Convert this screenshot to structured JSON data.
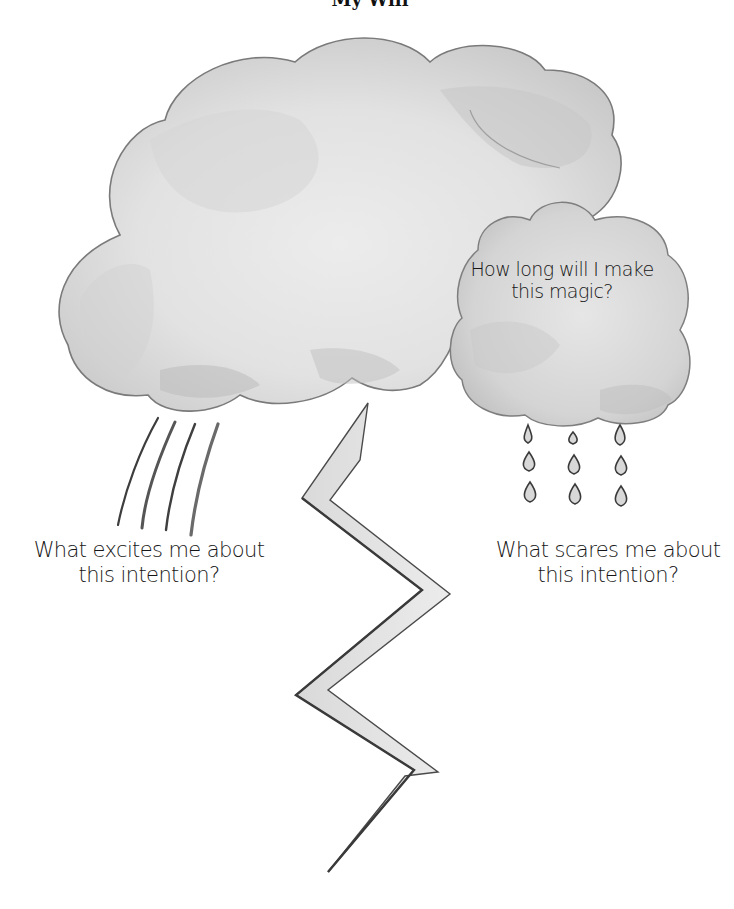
{
  "page": {
    "header_fragment": "My Will",
    "colors": {
      "background": "#ffffff",
      "cloud_fill": "#e4e4e4",
      "cloud_wash": "#cfcfcf",
      "cloud_edge": "#6a6a6a",
      "text": "#161616"
    }
  },
  "illustration": {
    "main_cloud": {
      "name": "storm-cloud",
      "description": "large grey watercolor cloud"
    },
    "small_cloud": {
      "name": "rain-cloud",
      "prompt_lines": [
        "How long will I make",
        "this magic?"
      ]
    },
    "wind_lines": {
      "count": 4
    },
    "raindrops": {
      "rows": 3,
      "columns": 3
    },
    "lightning_bolt": {
      "segments": 5
    }
  },
  "prompts": {
    "excites": {
      "lines": [
        "What excites me about",
        "this intention?"
      ]
    },
    "scares": {
      "lines": [
        "What scares me about",
        "this intention?"
      ]
    }
  }
}
